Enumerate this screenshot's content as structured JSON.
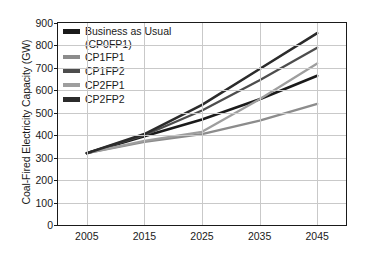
{
  "chart_data": {
    "type": "line",
    "title": "",
    "xlabel": "",
    "ylabel": "Coal-Fired Electricity Capacity (GW)",
    "x": [
      2005,
      2015,
      2025,
      2035,
      2045
    ],
    "xlim": [
      2000,
      2050
    ],
    "ylim": [
      0,
      900
    ],
    "ytick_labels": [
      "0",
      "100",
      "200",
      "300",
      "400",
      "500",
      "600",
      "700",
      "800",
      "900"
    ],
    "yticks": [
      0,
      100,
      200,
      300,
      400,
      500,
      600,
      700,
      800,
      900
    ],
    "xtick_labels": [
      "2005",
      "2015",
      "2025",
      "2035",
      "2045"
    ],
    "xticks": [
      2005,
      2015,
      2025,
      2035,
      2045
    ],
    "grid": "both",
    "legend_position": "upper-left-inside",
    "series": [
      {
        "name": "Business as Usual (CP0FP1)",
        "legend_label_line1": "Business as Usual",
        "legend_label_line2": "(CP0FP1)",
        "color": "#1a1a1a",
        "width": 2.6,
        "values": [
          320,
          395,
          470,
          560,
          665
        ]
      },
      {
        "name": "CP1FP1",
        "legend_label_line1": "CP1FP1",
        "legend_label_line2": "",
        "color": "#8c8c8c",
        "width": 2.3,
        "values": [
          320,
          370,
          405,
          465,
          540
        ]
      },
      {
        "name": "CP1FP2",
        "legend_label_line1": "CP1FP2",
        "legend_label_line2": "",
        "color": "#4d4d4d",
        "width": 2.3,
        "values": [
          320,
          400,
          510,
          645,
          790
        ]
      },
      {
        "name": "CP2FP1",
        "legend_label_line1": "CP2FP1",
        "legend_label_line2": "",
        "color": "#9e9e9e",
        "width": 2.3,
        "values": [
          320,
          375,
          415,
          560,
          720
        ]
      },
      {
        "name": "CP2FP2",
        "legend_label_line1": "CP2FP2",
        "legend_label_line2": "",
        "color": "#2b2b2b",
        "width": 2.6,
        "values": [
          320,
          405,
          535,
          695,
          855
        ]
      }
    ]
  }
}
